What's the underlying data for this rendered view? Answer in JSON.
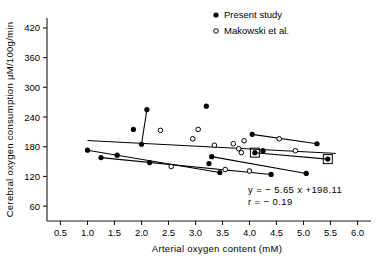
{
  "chart_data": {
    "type": "scatter",
    "title": "",
    "xlabel": "Arterial oxygen content  (mM)",
    "ylabel": "Cerebral oxygen consumption µM/100g/min",
    "xlim": [
      0.25,
      6.25
    ],
    "ylim": [
      30,
      440
    ],
    "xticks": [
      0.5,
      1.0,
      1.5,
      2.0,
      2.5,
      3.0,
      3.5,
      4.0,
      4.5,
      5.0,
      5.5,
      6.0
    ],
    "xtick_labels": [
      "0.5",
      "1.0",
      "1.5",
      "2.0",
      "2.5",
      "3.0",
      "3.5",
      "4.0",
      "4.5",
      "5.0",
      "5.5",
      "6.0"
    ],
    "yticks": [
      60,
      120,
      180,
      240,
      300,
      360,
      420
    ],
    "ytick_labels": [
      "60",
      "120",
      "180",
      "240",
      "300",
      "360",
      "420"
    ],
    "grid": false,
    "legend_position": "top-right",
    "legend": [
      {
        "label": "Present  study",
        "marker": "filled-circle"
      },
      {
        "label": "Makowski et al.",
        "marker": "open-circle"
      }
    ],
    "annotations": [
      {
        "name": "regression-equation",
        "text": "y  =  − 5.65 x  +198.11"
      },
      {
        "name": "correlation-coefficient",
        "text": "r  =  − 0.19"
      }
    ],
    "regression": {
      "slope": -5.65,
      "intercept": 198.11,
      "r": -0.19,
      "x_start": 1.0,
      "x_end": 5.6
    },
    "series": [
      {
        "name": "Present  study",
        "marker": "filled-circle",
        "points": [
          {
            "x": 1.0,
            "y": 173
          },
          {
            "x": 1.25,
            "y": 158
          },
          {
            "x": 1.55,
            "y": 163
          },
          {
            "x": 1.85,
            "y": 215
          },
          {
            "x": 2.0,
            "y": 185
          },
          {
            "x": 2.1,
            "y": 255
          },
          {
            "x": 2.15,
            "y": 148
          },
          {
            "x": 3.2,
            "y": 262
          },
          {
            "x": 3.25,
            "y": 146
          },
          {
            "x": 3.3,
            "y": 160
          },
          {
            "x": 3.45,
            "y": 128
          },
          {
            "x": 4.05,
            "y": 205
          },
          {
            "x": 4.1,
            "y": 168
          },
          {
            "x": 4.25,
            "y": 172
          },
          {
            "x": 4.4,
            "y": 124
          },
          {
            "x": 5.25,
            "y": 186
          },
          {
            "x": 5.45,
            "y": 155
          },
          {
            "x": 5.05,
            "y": 126
          }
        ]
      },
      {
        "name": "Makowski et al.",
        "marker": "open-circle",
        "points": [
          {
            "x": 2.35,
            "y": 213
          },
          {
            "x": 2.55,
            "y": 140
          },
          {
            "x": 2.95,
            "y": 196
          },
          {
            "x": 3.05,
            "y": 215
          },
          {
            "x": 3.35,
            "y": 183
          },
          {
            "x": 3.55,
            "y": 134
          },
          {
            "x": 3.7,
            "y": 186
          },
          {
            "x": 3.8,
            "y": 176
          },
          {
            "x": 3.85,
            "y": 168
          },
          {
            "x": 3.9,
            "y": 192
          },
          {
            "x": 4.0,
            "y": 131
          },
          {
            "x": 4.55,
            "y": 196
          },
          {
            "x": 4.85,
            "y": 172
          }
        ]
      }
    ],
    "paired_connections": [
      {
        "name": "pair-1",
        "x1": 1.0,
        "y1": 173,
        "x2": 3.45,
        "y2": 128
      },
      {
        "name": "pair-2",
        "x1": 1.25,
        "y1": 158,
        "x2": 4.4,
        "y2": 124
      },
      {
        "name": "pair-3",
        "x1": 2.0,
        "y1": 185,
        "x2": 2.1,
        "y2": 255
      },
      {
        "name": "pair-4",
        "x1": 4.05,
        "y1": 205,
        "x2": 5.25,
        "y2": 186
      },
      {
        "name": "pair-5",
        "x1": 4.1,
        "y1": 168,
        "x2": 5.45,
        "y2": 155
      },
      {
        "name": "pair-6",
        "x1": 3.3,
        "y1": 160,
        "x2": 5.05,
        "y2": 126
      }
    ],
    "boxed_points": [
      {
        "name": "boxed-point-left",
        "x": 4.1,
        "y": 168
      },
      {
        "name": "boxed-point-right",
        "x": 5.45,
        "y": 155
      }
    ]
  }
}
